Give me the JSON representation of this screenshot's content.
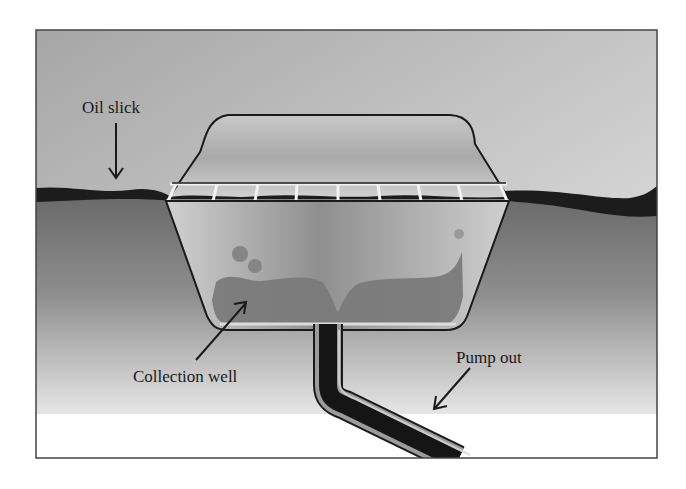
{
  "figure": {
    "labels": {
      "oil_slick": "Oil slick",
      "collection_well": "Collection well",
      "pump_out": "Pump out"
    },
    "colors": {
      "sky_top": "#a9a9a9",
      "sky_bottom": "#e2e2e2",
      "water_top": "#6e6e6e",
      "water_bottom": "#e4e4e4",
      "oil": "#1c1c1c",
      "well_body": "#c4c4c4",
      "collected_oil": "#7d7d7d",
      "outline": "#1a1a1a"
    },
    "skimmer_slots": 8
  }
}
